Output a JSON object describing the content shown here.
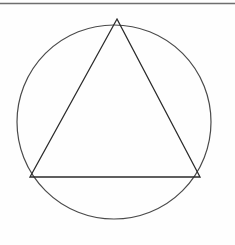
{
  "figure": {
    "title": "Equilateral triangle inscribed in a circle",
    "canvas": {
      "width": 235,
      "height": 245,
      "background_color": "#fefefe"
    },
    "top_rule": {
      "name": "horizontal-rule",
      "x1": 0,
      "y1": 3.5,
      "x2": 235,
      "y2": 3.5,
      "color": "#6e6e6e",
      "stroke_width": 1.4
    },
    "circle": {
      "name": "circumscribed-circle",
      "center_x": 114,
      "center_y": 122,
      "radius": 97,
      "color": "#4a4a4a",
      "stroke_width": 1.2,
      "fill": "none"
    },
    "triangle": {
      "name": "inscribed-triangle",
      "kind": "equilateral",
      "color": "#2b2b2b",
      "stroke_width": 1.3,
      "fill": "none",
      "vertices": [
        {
          "label": "apex",
          "x": 117,
          "y": 19
        },
        {
          "label": "base-right",
          "x": 200,
          "y": 177
        },
        {
          "label": "base-left",
          "x": 30,
          "y": 177
        }
      ],
      "points_attr": "117,19 200,177 30,177"
    },
    "base_line": {
      "name": "triangle-base",
      "x1": 30,
      "y1": 177,
      "x2": 200,
      "y2": 177,
      "color": "#2b2b2b",
      "stroke_width": 1.3
    }
  }
}
